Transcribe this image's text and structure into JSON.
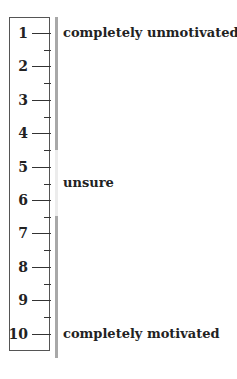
{
  "scale": {
    "ticks": [
      "1",
      "2",
      "3",
      "4",
      "5",
      "6",
      "7",
      "8",
      "9",
      "10"
    ],
    "labels": {
      "top": "completely unmotivated",
      "middle": "unsure",
      "bottom": "completely motivated"
    },
    "colors": {
      "bar_dark": "#a8a8a8",
      "bar_light": "#ececec",
      "border": "#555555",
      "text": "#222222"
    }
  }
}
